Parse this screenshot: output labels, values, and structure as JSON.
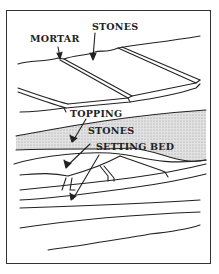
{
  "diagram": {
    "labels": {
      "mortar": "MORTAR",
      "stones_top": "STONES",
      "topping": "TOPPING",
      "stones_section": "STONES",
      "setting_bed": "SETTING BED"
    },
    "colors": {
      "line": "#222222",
      "topping_fill": "#d4d4d4",
      "background": "#ffffff"
    }
  }
}
